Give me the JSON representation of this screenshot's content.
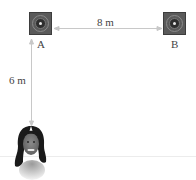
{
  "diagram": {
    "speakers": [
      {
        "id": "A",
        "label": "A"
      },
      {
        "id": "B",
        "label": "B"
      }
    ],
    "dimensions": {
      "horizontal": {
        "label": "8 m",
        "from": "A",
        "to": "B"
      },
      "vertical": {
        "label": "6 m",
        "from": "A",
        "to": "listener"
      }
    },
    "listener": {
      "icon": "person-face-icon"
    },
    "colors": {
      "speaker_fill": "#5a5a5a",
      "arrow": "#c8c8c8",
      "text": "#444444"
    }
  }
}
